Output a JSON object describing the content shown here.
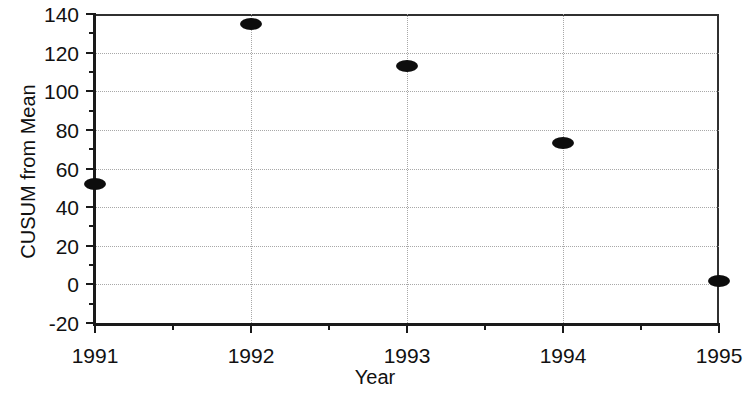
{
  "chart_data": {
    "type": "scatter",
    "title": "",
    "xlabel": "Year",
    "ylabel": "CUSUM from Mean",
    "categories": [
      "1991",
      "1992",
      "1993",
      "1994",
      "1995"
    ],
    "values": [
      52,
      135,
      113,
      73,
      2
    ],
    "series": [
      {
        "name": "CUSUM from Mean",
        "values": [
          52,
          135,
          113,
          73,
          2
        ]
      }
    ],
    "points": [
      {
        "x": "1991",
        "y": 52
      },
      {
        "x": "1992",
        "y": 135
      },
      {
        "x": "1993",
        "y": 113
      },
      {
        "x": "1994",
        "y": 73
      },
      {
        "x": "1995",
        "y": 2
      }
    ],
    "ylim": [
      -20,
      140
    ],
    "ytick_labels": [
      "140",
      "120",
      "100",
      "80",
      "60",
      "40",
      "20",
      "0",
      "-20"
    ],
    "ytick_values": [
      140,
      120,
      100,
      80,
      60,
      40,
      20,
      0,
      -20
    ],
    "yminor_values": [
      130,
      110,
      90,
      70,
      50,
      30,
      10,
      -10
    ],
    "xtick_labels": [
      "1991",
      "1992",
      "1993",
      "1994",
      "1995"
    ],
    "grid": "dotted-both",
    "legend": "none",
    "marker_color": "#0d0d0d",
    "marker_shape": "filled-ellipse",
    "axis_color": "#1a1a1a",
    "grid_color": "#a8a8a8",
    "background_color": "#ffffff"
  }
}
